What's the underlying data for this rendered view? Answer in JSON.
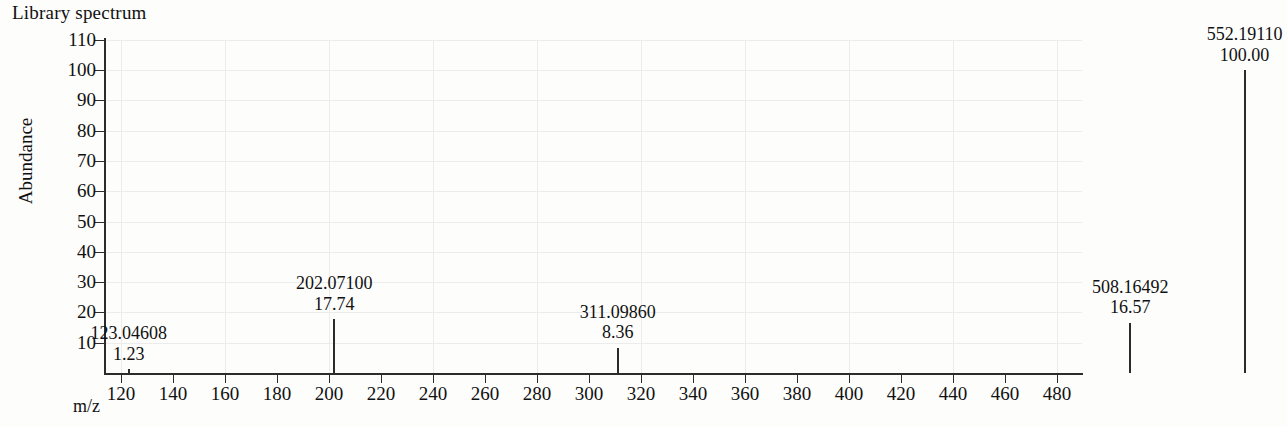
{
  "figure": {
    "title": "Library spectrum",
    "x_axis_title": "m/z",
    "y_axis_title": "Abundance"
  },
  "chart_data": {
    "type": "bar",
    "title": "Library spectrum",
    "subtitle": "",
    "xlabel": "m/z",
    "ylabel": "Abundance",
    "xlim": [
      100,
      570
    ],
    "ylim": [
      0,
      110
    ],
    "grid": true,
    "legend_position": "none",
    "x_ticks": [
      120,
      140,
      160,
      180,
      200,
      220,
      240,
      260,
      280,
      300,
      320,
      340,
      360,
      380,
      400,
      420,
      440,
      460,
      480,
      500,
      520,
      540,
      560
    ],
    "y_ticks": [
      10,
      20,
      30,
      40,
      50,
      60,
      70,
      80,
      90,
      100,
      110
    ],
    "x": [
      123.04608,
      202.071,
      311.0986,
      508.16492,
      552.1911
    ],
    "values": [
      1.23,
      17.74,
      8.36,
      16.57,
      100.0
    ],
    "peaks": [
      {
        "mz": "123.04608",
        "abundance": "1.23",
        "mz_value": 123.04608,
        "abundance_value": 1.23
      },
      {
        "mz": "202.07100",
        "abundance": "17.74",
        "mz_value": 202.071,
        "abundance_value": 17.74
      },
      {
        "mz": "311.09860",
        "abundance": "8.36",
        "mz_value": 311.0986,
        "abundance_value": 8.36
      },
      {
        "mz": "508.16492",
        "abundance": "16.57",
        "mz_value": 508.16492,
        "abundance_value": 16.57
      },
      {
        "mz": "552.19110",
        "abundance": "100.00",
        "mz_value": 552.1911,
        "abundance_value": 100.0
      }
    ]
  },
  "colors": {
    "axis": "#2c2c2c",
    "peak": "#2b2b2b",
    "grid": "#ececed",
    "background": "#fdfdfc",
    "text": "#111111"
  }
}
